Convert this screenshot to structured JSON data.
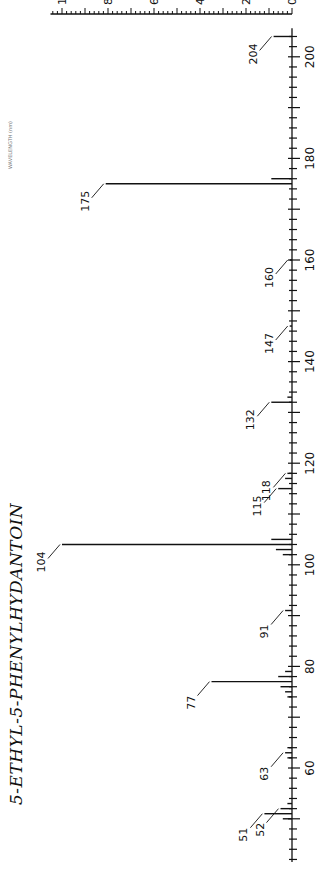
{
  "chart_data": {
    "type": "bar",
    "title": "5-ETHYL-5-PHENYLHYDANTOIN",
    "orientation": "rotated 90deg (m/z runs vertically bottom-to-top, intensity runs right-to-left)",
    "xlabel": "WAVELENGTH (nm)",
    "ylabel": "",
    "x_axis": {
      "label": "m/z",
      "range": [
        40,
        206
      ],
      "ticks": [
        60,
        80,
        100,
        120,
        140,
        160,
        180,
        200
      ]
    },
    "y_axis": {
      "label": "Relative intensity",
      "range": [
        0,
        100
      ],
      "ticks": [
        0,
        20,
        40,
        60,
        80,
        100
      ]
    },
    "grid": false,
    "labeled_peaks": [
      51,
      52,
      63,
      77,
      91,
      104,
      115,
      118,
      132,
      147,
      160,
      175,
      204
    ],
    "peaks": [
      {
        "mz": 50,
        "intensity": 4
      },
      {
        "mz": 51,
        "intensity": 12,
        "label": "51"
      },
      {
        "mz": 52,
        "intensity": 5,
        "label": "52"
      },
      {
        "mz": 53,
        "intensity": 2
      },
      {
        "mz": 62,
        "intensity": 2
      },
      {
        "mz": 63,
        "intensity": 3,
        "label": "63"
      },
      {
        "mz": 64,
        "intensity": 2
      },
      {
        "mz": 74,
        "intensity": 2
      },
      {
        "mz": 75,
        "intensity": 3
      },
      {
        "mz": 76,
        "intensity": 5
      },
      {
        "mz": 77,
        "intensity": 35,
        "label": "77"
      },
      {
        "mz": 78,
        "intensity": 6
      },
      {
        "mz": 79,
        "intensity": 3
      },
      {
        "mz": 91,
        "intensity": 3,
        "label": "91"
      },
      {
        "mz": 102,
        "intensity": 4
      },
      {
        "mz": 103,
        "intensity": 7
      },
      {
        "mz": 104,
        "intensity": 100,
        "label": "104"
      },
      {
        "mz": 105,
        "intensity": 9
      },
      {
        "mz": 115,
        "intensity": 6,
        "label": "115"
      },
      {
        "mz": 117,
        "intensity": 3
      },
      {
        "mz": 118,
        "intensity": 2,
        "label": "118"
      },
      {
        "mz": 132,
        "intensity": 9,
        "label": "132"
      },
      {
        "mz": 133,
        "intensity": 2
      },
      {
        "mz": 147,
        "intensity": 1,
        "label": "147"
      },
      {
        "mz": 160,
        "intensity": 1,
        "label": "160"
      },
      {
        "mz": 175,
        "intensity": 81,
        "label": "175"
      },
      {
        "mz": 176,
        "intensity": 9
      },
      {
        "mz": 204,
        "intensity": 8,
        "label": "204"
      }
    ]
  }
}
